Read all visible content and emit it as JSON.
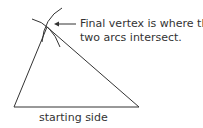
{
  "diagram": {
    "annotation_line1": "Final vertex is where the",
    "annotation_line2": "two arcs intersect.",
    "base_label": "starting side",
    "stroke_color": "#333333"
  }
}
